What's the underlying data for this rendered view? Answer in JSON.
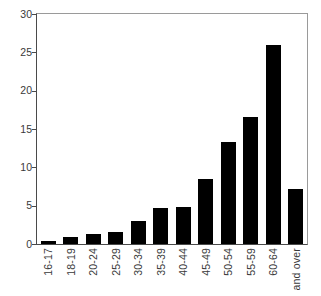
{
  "chart_data": {
    "type": "bar",
    "title": "",
    "subtitle": "",
    "xlabel": "",
    "ylabel": "",
    "categories": [
      "16-17",
      "18-19",
      "20-24",
      "25-29",
      "30-34",
      "35-39",
      "40-44",
      "45-49",
      "50-54",
      "55-59",
      "60-64",
      "and over"
    ],
    "values": [
      0.4,
      0.9,
      1.3,
      1.6,
      3.0,
      4.7,
      4.8,
      8.5,
      13.3,
      16.6,
      26.0,
      7.2
    ],
    "ylim": [
      0,
      30
    ],
    "ytick_values": [
      0,
      5,
      10,
      15,
      20,
      25,
      30
    ],
    "ytick_labels": [
      "0",
      "5",
      "10",
      "15",
      "20",
      "25",
      "30"
    ],
    "grid": false,
    "legend": null,
    "bar_color": "#000000",
    "axis_color": "#4a4a4a",
    "frame_color": "#9a9a9a",
    "background": "#ffffff",
    "xtick_label_rotation": 90
  }
}
